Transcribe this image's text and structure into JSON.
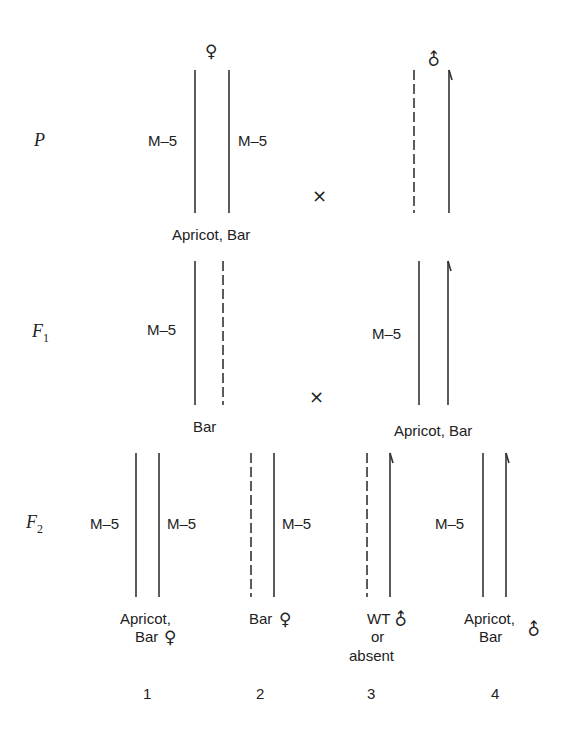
{
  "generations": {
    "p": {
      "label": "P"
    },
    "f1": {
      "label": "F",
      "sub": "1"
    },
    "f2": {
      "label": "F",
      "sub": "2"
    }
  },
  "symbols": {
    "female": "♀",
    "male": "♂",
    "cross": "×"
  },
  "labels": {
    "m5": "M–5",
    "p_female": "Apricot, Bar",
    "f1_female": "Bar",
    "f1_male": "Apricot, Bar",
    "f2_1_line1": "Apricot,",
    "f2_1_line2": "Bar",
    "f2_2": "Bar",
    "f2_3_line1": "WT",
    "f2_3_line2": "or",
    "f2_3_line3": "absent",
    "f2_4_line1": "Apricot,",
    "f2_4_line2": "Bar"
  },
  "numbers": [
    "1",
    "2",
    "3",
    "4"
  ],
  "colors": {
    "line": "#333333",
    "text": "#222222",
    "background": "#ffffff"
  }
}
